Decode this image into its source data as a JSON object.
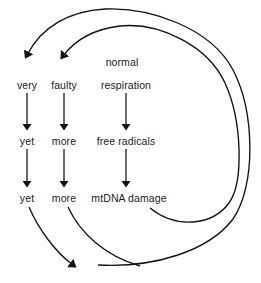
{
  "diagram": {
    "stroke_color": "#111111",
    "text_color": "#1b1b1b",
    "background_color": "#ffffff",
    "nodes": [
      {
        "id": "normal",
        "label": "normal",
        "x": 122,
        "y": 62
      },
      {
        "id": "very",
        "label": "very",
        "x": 27,
        "y": 85
      },
      {
        "id": "faulty",
        "label": "faulty",
        "x": 64,
        "y": 85
      },
      {
        "id": "respiration",
        "label": "respiration",
        "x": 126,
        "y": 85
      },
      {
        "id": "yet1",
        "label": "yet",
        "x": 27,
        "y": 141
      },
      {
        "id": "more1",
        "label": "more",
        "x": 64,
        "y": 141
      },
      {
        "id": "free-radicals",
        "label": "free radicals",
        "x": 126,
        "y": 141
      },
      {
        "id": "yet2",
        "label": "yet",
        "x": 27,
        "y": 198
      },
      {
        "id": "more2",
        "label": "more",
        "x": 64,
        "y": 198
      },
      {
        "id": "mtdna-damage",
        "label": "mtDNA damage",
        "x": 129,
        "y": 198
      }
    ],
    "vertical_arrows": [
      {
        "id": "very-to-yet",
        "from": "very",
        "to": "yet1"
      },
      {
        "id": "faulty-to-more",
        "from": "faulty",
        "to": "more1"
      },
      {
        "id": "respiration-to-free-radicals",
        "from": "respiration",
        "to": "free-radicals"
      },
      {
        "id": "yet-to-yet",
        "from": "yet1",
        "to": "yet2"
      },
      {
        "id": "more-to-more",
        "from": "more1",
        "to": "more2"
      },
      {
        "id": "free-radicals-to-mtdna",
        "from": "free-radicals",
        "to": "mtdna-damage"
      }
    ],
    "feedback_loops": [
      {
        "id": "inner-loop",
        "from": "mtdna-damage",
        "to": "faulty",
        "description": "mtDNA damage loops back to faulty respiration"
      },
      {
        "id": "outer-loop",
        "from": "more2",
        "to": "very",
        "description": "more mtDNA damage loops back to very faulty respiration"
      }
    ],
    "continuation_arrows": [
      {
        "id": "yet-continuation",
        "from": "yet2",
        "description": "curve descending to lower left toward continuation arrowhead"
      },
      {
        "id": "more-continuation",
        "from": "more2",
        "description": "curve descending toward continuation arrowhead"
      }
    ]
  }
}
